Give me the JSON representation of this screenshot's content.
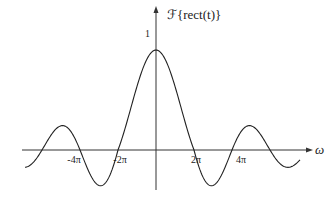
{
  "chart_data": {
    "type": "line",
    "title": "",
    "function": "sinc: F{rect(t)} = sin(ω/2)/(ω/2)",
    "xlabel": "ω",
    "ylabel": "ℱ{rect(t)}",
    "x_ticks": [
      "-4π",
      "-2π",
      "2π",
      "4π"
    ],
    "x_tick_values": [
      -12.566,
      -6.283,
      6.283,
      12.566
    ],
    "y_ticks": [
      "1"
    ],
    "y_tick_values": [
      1
    ],
    "xlim": [
      -17.5,
      17.5
    ],
    "ylim": [
      -0.25,
      1.05
    ],
    "grid": false,
    "legend": null,
    "series": [
      {
        "name": "sinc(ω/2)",
        "x": [
          -17,
          -14,
          -12.566,
          -9,
          -6.283,
          -3,
          0,
          3,
          6.283,
          9,
          12.566,
          14,
          17
        ],
        "values": [
          0.09,
          0.05,
          0.0,
          -0.22,
          0.0,
          0.67,
          1.0,
          0.67,
          0.0,
          -0.22,
          0.0,
          0.05,
          0.09
        ]
      }
    ],
    "zero_crossings": [
      "-4π",
      "-2π",
      "2π",
      "4π"
    ],
    "peak": {
      "x": 0,
      "y": 1
    }
  },
  "labels": {
    "y_axis": "ℱ{rect(t)}",
    "x_axis": "ω",
    "y_one": "1",
    "ticks": [
      "-4π",
      "-2π",
      "2π",
      "4π"
    ]
  }
}
